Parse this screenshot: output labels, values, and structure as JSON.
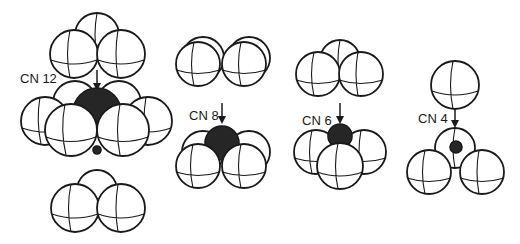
{
  "figure": {
    "panels": [
      {
        "id": "cn12",
        "label": "CN 12",
        "coordination_number": 12,
        "arrangement": "close-packed: triad above, hexagonal ring of six around center, triad below"
      },
      {
        "id": "cn8",
        "label": "CN 8",
        "coordination_number": 8,
        "arrangement": "cubic: four spheres above, four below"
      },
      {
        "id": "cn6",
        "label": "CN 6",
        "coordination_number": 6,
        "arrangement": "octahedral: three above, three below"
      },
      {
        "id": "cn4",
        "label": "CN 4",
        "coordination_number": 4,
        "arrangement": "tetrahedral: one above, three below"
      }
    ]
  },
  "colors": {
    "sphere_fill": "#ffffff",
    "sphere_outline": "#1a1a1a",
    "central_atom": "#262626",
    "background": "#ffffff"
  }
}
